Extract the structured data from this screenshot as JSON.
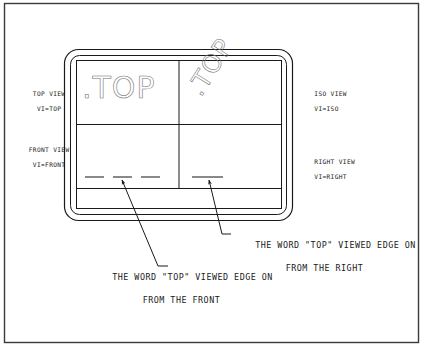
{
  "page": {
    "background_color": "#ffffff",
    "line_color": "#1a1a1a",
    "screen_text_color": "#6e6e6e"
  },
  "viewports": {
    "top_left": {
      "label_line1": "TOP VIEW",
      "label_line2": "VI=TOP",
      "content_word": ".TOP",
      "content_rotation_deg": 0
    },
    "top_right": {
      "label_line1": "ISO VIEW",
      "label_line2": "VI=ISO",
      "content_word": ".TOP",
      "content_rotation_deg": -58
    },
    "bottom_left": {
      "label_line1": "FRONT VIEW",
      "label_line2": "VI=FRONT",
      "content_word": "",
      "edge_on_dashes": 3
    },
    "bottom_right": {
      "label_line1": "RIGHT VIEW",
      "label_line2": "VI=RIGHT",
      "content_word": "",
      "edge_on_dashes": 1
    }
  },
  "annotations": {
    "right": {
      "line1": "THE WORD \"TOP\" VIEWED EDGE ON",
      "line2": "FROM THE RIGHT"
    },
    "front": {
      "line1": "THE WORD \"TOP\" VIEWED EDGE ON",
      "line2": "FROM THE FRONT"
    }
  }
}
